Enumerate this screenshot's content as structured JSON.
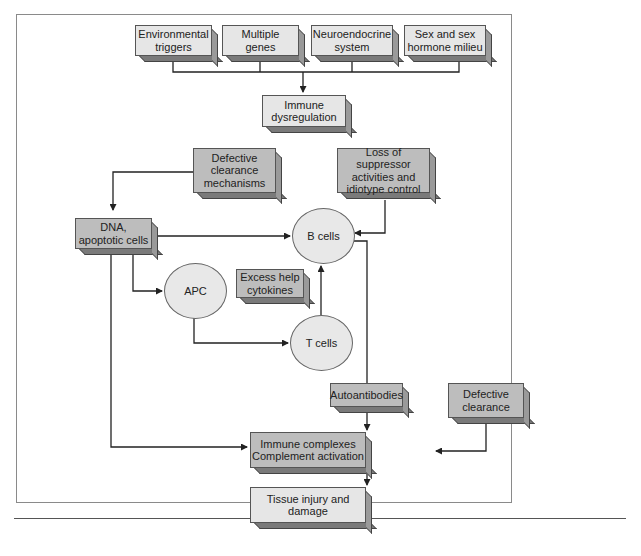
{
  "diagram": {
    "nodes": {
      "environmental_triggers": "Environmental\ntriggers",
      "multiple_genes": "Multiple\ngenes",
      "neuroendocrine_system": "Neuroendocrine\nsystem",
      "sex_hormone_milieu": "Sex and sex\nhormone milieu",
      "immune_dysregulation": "Immune\ndysregulation",
      "defective_clearance_mechanisms": "Defective\nclearance\nmechanisms",
      "loss_of_suppressor": "Loss of suppressor\nactivities and\nidiotype control",
      "dna_apoptotic_cells": "DNA,\napoptotic cells",
      "b_cells": "B cells",
      "apc": "APC",
      "excess_help_cytokines": "Excess help\ncytokines",
      "t_cells": "T cells",
      "autoantibodies": "Autoantibodies",
      "defective_clearance": "Defective\nclearance",
      "immune_complexes": "Immune complexes\nComplement activation",
      "tissue_injury": "Tissue injury and\ndamage"
    },
    "edges": [
      [
        "environmental_triggers",
        "immune_dysregulation"
      ],
      [
        "multiple_genes",
        "immune_dysregulation"
      ],
      [
        "neuroendocrine_system",
        "immune_dysregulation"
      ],
      [
        "sex_hormone_milieu",
        "immune_dysregulation"
      ],
      [
        "defective_clearance_mechanisms",
        "dna_apoptotic_cells"
      ],
      [
        "dna_apoptotic_cells",
        "b_cells"
      ],
      [
        "loss_of_suppressor",
        "b_cells"
      ],
      [
        "dna_apoptotic_cells",
        "apc"
      ],
      [
        "apc",
        "t_cells"
      ],
      [
        "t_cells",
        "b_cells"
      ],
      [
        "b_cells",
        "autoantibodies"
      ],
      [
        "autoantibodies",
        "immune_complexes"
      ],
      [
        "dna_apoptotic_cells",
        "immune_complexes"
      ],
      [
        "defective_clearance",
        "immune_complexes"
      ],
      [
        "immune_complexes",
        "tissue_injury"
      ]
    ],
    "colors": {
      "light_box": "#e6e6e6",
      "dark_box": "#bdbdbd",
      "ellipse": "#e8e8e8",
      "line": "#222222"
    }
  }
}
